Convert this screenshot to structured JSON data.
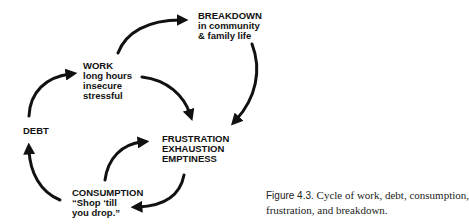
{
  "diagram": {
    "type": "cycle",
    "nodes": {
      "breakdown": {
        "title": "BREAKDOWN",
        "lines": [
          "in community",
          "& family life"
        ]
      },
      "work": {
        "title": "WORK",
        "lines": [
          "long hours",
          "insecure",
          "stressful"
        ]
      },
      "debt": {
        "title": "DEBT",
        "lines": []
      },
      "frustration": {
        "title": "FRUSTRATION",
        "lines": [
          "EXHAUSTION",
          "EMPTINESS"
        ]
      },
      "consumption": {
        "title": "CONSUMPTION",
        "lines": [
          "“Shop ‘till",
          "you drop.”"
        ]
      }
    },
    "edges": [
      {
        "from": "work",
        "to": "breakdown"
      },
      {
        "from": "breakdown",
        "to": "frustration"
      },
      {
        "from": "work",
        "to": "frustration"
      },
      {
        "from": "debt",
        "to": "work"
      },
      {
        "from": "consumption",
        "to": "debt"
      },
      {
        "from": "consumption",
        "to": "frustration"
      },
      {
        "from": "frustration",
        "to": "consumption"
      }
    ],
    "colors": {
      "ink": "#111111",
      "background": "#ffffff"
    }
  },
  "caption": {
    "label": "Figure 4.3.",
    "line1": "Cycle of work, debt, consumption,",
    "line2": "frustration, and breakdown."
  }
}
